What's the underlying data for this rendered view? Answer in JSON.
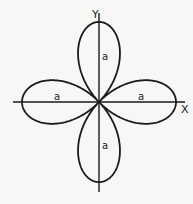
{
  "diagram": {
    "curve": "r = a cos 2θ",
    "origin": [
      99,
      102
    ],
    "petal_length_px": 77,
    "colors": {
      "background": "#f7f7f5",
      "ink": "#1a1a1a"
    },
    "axes": {
      "x": {
        "label": "X",
        "from": [
          13,
          102
        ],
        "to": [
          185,
          102
        ],
        "label_pos": [
          181,
          113
        ]
      },
      "y": {
        "label": "Y",
        "from": [
          99,
          13
        ],
        "to": [
          99,
          192
        ],
        "label_pos": [
          92,
          18
        ]
      }
    },
    "petal_labels": [
      {
        "text": "a",
        "pos": [
          102,
          60
        ],
        "petal": "top"
      },
      {
        "text": "a",
        "pos": [
          54,
          100
        ],
        "petal": "left"
      },
      {
        "text": "a",
        "pos": [
          138,
          100
        ],
        "petal": "right"
      },
      {
        "text": "a",
        "pos": [
          102,
          149
        ],
        "petal": "bottom"
      }
    ]
  }
}
